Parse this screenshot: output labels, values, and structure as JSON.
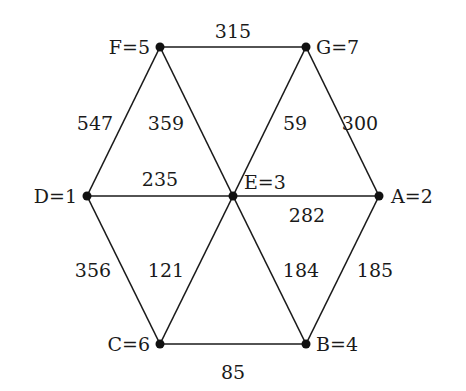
{
  "diagram": {
    "type": "weighted-graph",
    "nodes": [
      {
        "id": "A",
        "label": "A=2",
        "x": 379,
        "y": 196,
        "lx": 391,
        "ly": 203,
        "anchor": "start"
      },
      {
        "id": "B",
        "label": "B=4",
        "x": 306,
        "y": 344,
        "lx": 316,
        "ly": 351,
        "anchor": "start"
      },
      {
        "id": "C",
        "label": "C=6",
        "x": 160,
        "y": 344,
        "lx": 150,
        "ly": 351,
        "anchor": "end"
      },
      {
        "id": "D",
        "label": "D=1",
        "x": 87,
        "y": 196,
        "lx": 77,
        "ly": 203,
        "anchor": "end"
      },
      {
        "id": "E",
        "label": "E=3",
        "x": 233,
        "y": 196,
        "lx": 244,
        "ly": 189,
        "anchor": "start"
      },
      {
        "id": "F",
        "label": "F=5",
        "x": 160,
        "y": 47,
        "lx": 150,
        "ly": 54,
        "anchor": "end"
      },
      {
        "id": "G",
        "label": "G=7",
        "x": 306,
        "y": 47,
        "lx": 316,
        "ly": 54,
        "anchor": "start"
      }
    ],
    "edges": [
      {
        "from": "F",
        "to": "G",
        "weight": "315",
        "lx": 233,
        "ly": 38
      },
      {
        "from": "F",
        "to": "D",
        "weight": "547",
        "lx": 95,
        "ly": 130
      },
      {
        "from": "F",
        "to": "E",
        "weight": "359",
        "lx": 166,
        "ly": 130
      },
      {
        "from": "G",
        "to": "E",
        "weight": "59",
        "lx": 295,
        "ly": 130
      },
      {
        "from": "G",
        "to": "A",
        "weight": "300",
        "lx": 360,
        "ly": 130
      },
      {
        "from": "D",
        "to": "E",
        "weight": "235",
        "lx": 160,
        "ly": 186
      },
      {
        "from": "E",
        "to": "A",
        "weight": "282",
        "lx": 307,
        "ly": 222
      },
      {
        "from": "D",
        "to": "C",
        "weight": "356",
        "lx": 93,
        "ly": 277
      },
      {
        "from": "E",
        "to": "C",
        "weight": "121",
        "lx": 166,
        "ly": 277
      },
      {
        "from": "E",
        "to": "B",
        "weight": "184",
        "lx": 301,
        "ly": 277
      },
      {
        "from": "A",
        "to": "B",
        "weight": "185",
        "lx": 375,
        "ly": 277
      },
      {
        "from": "C",
        "to": "B",
        "weight": "85",
        "lx": 233,
        "ly": 379
      }
    ]
  }
}
